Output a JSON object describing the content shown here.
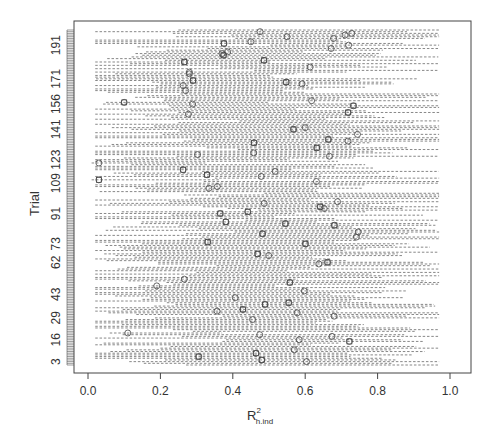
{
  "chart_data": {
    "type": "forest",
    "title": "",
    "xlabel": "R² h.ind",
    "xlabel_main": "R",
    "xlabel_sup": "2",
    "xlabel_sub": "h.ind",
    "ylabel": "Trial",
    "xlim": [
      -0.03,
      1.03
    ],
    "x_ticks": [
      0.0,
      0.2,
      0.4,
      0.6,
      0.8,
      1.0
    ],
    "x_tick_labels": [
      "0.0",
      "0.2",
      "0.4",
      "0.6",
      "0.8",
      "1.0"
    ],
    "y_tick_labels": [
      "3",
      "16",
      "29",
      "43",
      "62",
      "73",
      "91",
      "109",
      "123",
      "141",
      "156",
      "171",
      "191"
    ],
    "y_tick_values": [
      3,
      16,
      29,
      43,
      62,
      73,
      91,
      109,
      123,
      141,
      156,
      171,
      191
    ],
    "n_trials": 200,
    "grid": false,
    "legend": null,
    "style": {
      "line_color": "#555555",
      "line_dash": "dashed",
      "point_marker": "open circle",
      "secondary_marker": "open square"
    },
    "notable_points": [
      {
        "trial": 157,
        "estimate": 0.1
      },
      {
        "trial": 121,
        "estimate": 0.03
      },
      {
        "trial": 111,
        "estimate": 0.03
      },
      {
        "trial": 48,
        "estimate": 0.19
      },
      {
        "trial": 20,
        "estimate": 0.11
      },
      {
        "trial": 196,
        "estimate": 0.55
      },
      {
        "trial": 193,
        "estimate": 0.45
      },
      {
        "trial": 191,
        "estimate": 0.72
      },
      {
        "trial": 186,
        "estimate": 0.37
      },
      {
        "trial": 174,
        "estimate": 0.28
      },
      {
        "trial": 170,
        "estimate": 0.29
      },
      {
        "trial": 10,
        "estimate": 0.57
      },
      {
        "trial": 4,
        "estimate": 0.48
      }
    ]
  },
  "axes": {
    "x_label_main": "R",
    "x_label_sup": "2",
    "x_label_sub": "h.ind",
    "y_label": "Trial"
  }
}
